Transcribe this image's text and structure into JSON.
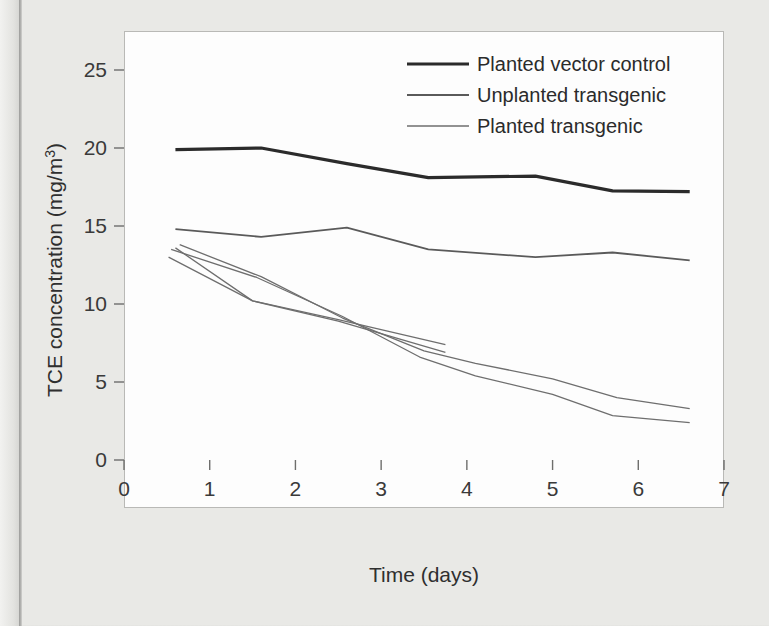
{
  "figure": {
    "background_color": "#e9e9e6",
    "plot_background_color": "#fdfdfd",
    "frame_color": "#b9b9b6"
  },
  "axis": {
    "x_title": "Time (days)",
    "y_title": "TCE concentration (mg/m3)",
    "y_title_display": "TCE concentration (mg/m",
    "y_title_super": "3",
    "y_title_tail": ")",
    "x_ticks": [
      "0",
      "1",
      "2",
      "3",
      "4",
      "5",
      "6",
      "7"
    ],
    "y_ticks": [
      "0",
      "5",
      "10",
      "15",
      "20",
      "25"
    ]
  },
  "legend": {
    "position": "top-right-inside",
    "entries": [
      {
        "label": "Planted vector control",
        "color": "#2b2b2b",
        "width": 3.2
      },
      {
        "label": "Unplanted transgenic",
        "color": "#5a5a5a",
        "width": 1.8
      },
      {
        "label": "Planted transgenic",
        "color": "#6e6e6e",
        "width": 1.3
      }
    ]
  },
  "chart_data": {
    "type": "line",
    "title": "",
    "xlabel": "Time (days)",
    "ylabel": "TCE concentration (mg/m3)",
    "xlim": [
      0,
      7
    ],
    "ylim": [
      0,
      27
    ],
    "xticks": [
      0,
      1,
      2,
      3,
      4,
      5,
      6,
      7
    ],
    "yticks": [
      0,
      5,
      10,
      15,
      20,
      25
    ],
    "grid": false,
    "legend_position": "upper right",
    "series": [
      {
        "name": "Planted vector control",
        "legend": true,
        "color": "#2b2b2b",
        "width": 3.2,
        "x": [
          0.6,
          1.6,
          2.6,
          3.55,
          4.8,
          5.7,
          6.6
        ],
        "y": [
          19.9,
          20.0,
          19.0,
          18.1,
          18.2,
          17.25,
          17.2
        ]
      },
      {
        "name": "Unplanted transgenic",
        "legend": true,
        "color": "#5a5a5a",
        "width": 1.8,
        "x": [
          0.6,
          1.6,
          2.6,
          3.55,
          4.8,
          5.7,
          6.6
        ],
        "y": [
          14.8,
          14.3,
          14.9,
          13.5,
          13.0,
          13.3,
          12.8
        ]
      },
      {
        "name": "Planted transgenic replicate 1",
        "legend": false,
        "color": "#6e6e6e",
        "width": 1.3,
        "x": [
          0.55,
          1.55,
          2.55,
          3.45,
          4.1,
          5.0,
          5.7,
          6.6
        ],
        "y": [
          13.5,
          11.7,
          9.2,
          6.6,
          5.4,
          4.2,
          2.85,
          2.4
        ]
      },
      {
        "name": "Planted transgenic replicate 2",
        "legend": false,
        "color": "#6e6e6e",
        "width": 1.3,
        "x": [
          0.65,
          1.6,
          2.55,
          3.5,
          4.1,
          5.0,
          5.75,
          6.6
        ],
        "y": [
          13.8,
          11.75,
          9.1,
          7.0,
          6.2,
          5.2,
          4.0,
          3.3
        ]
      },
      {
        "name": "Planted transgenic replicate 3",
        "legend": false,
        "color": "#6e6e6e",
        "width": 1.3,
        "x": [
          0.6,
          1.5,
          2.5,
          3.75
        ],
        "y": [
          13.6,
          10.2,
          9.0,
          7.4
        ]
      },
      {
        "name": "Planted transgenic replicate 4",
        "legend": false,
        "color": "#6e6e6e",
        "width": 1.3,
        "x": [
          0.52,
          1.5,
          2.5,
          3.75
        ],
        "y": [
          13.0,
          10.2,
          8.9,
          6.9
        ]
      }
    ]
  }
}
